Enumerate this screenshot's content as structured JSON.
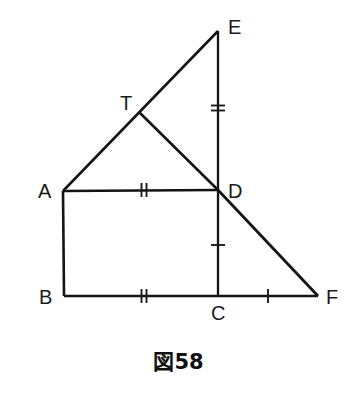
{
  "figure": {
    "caption": "図58",
    "background_color": "#ffffff",
    "line_color": "#141414",
    "label_color": "#1a1a1a",
    "vertices": [
      {
        "name": "A",
        "label": "A",
        "x": 63,
        "y": 191,
        "label_x": 38,
        "label_y": 198
      },
      {
        "name": "B",
        "label": "B",
        "x": 64,
        "y": 296,
        "label_x": 39,
        "label_y": 304
      },
      {
        "name": "C",
        "label": "C",
        "x": 218,
        "y": 296,
        "label_x": 211,
        "label_y": 320
      },
      {
        "name": "D",
        "label": "D",
        "x": 218,
        "y": 190,
        "label_x": 228,
        "label_y": 198
      },
      {
        "name": "E",
        "label": "E",
        "x": 218,
        "y": 31,
        "label_x": 228,
        "label_y": 34
      },
      {
        "name": "F",
        "label": "F",
        "x": 318,
        "y": 296,
        "label_x": 326,
        "label_y": 304
      },
      {
        "name": "T",
        "label": "T",
        "x": 140,
        "y": 113,
        "label_x": 120,
        "label_y": 110
      }
    ],
    "segments": [
      {
        "name": "segment-A-E",
        "from": "A",
        "to": "E",
        "x1": 63,
        "y1": 191,
        "x2": 218,
        "y2": 31,
        "width": 2.6
      },
      {
        "name": "segment-T-D",
        "from": "T",
        "to": "D",
        "x1": 140,
        "y1": 113,
        "x2": 218,
        "y2": 190,
        "width": 2.6
      },
      {
        "name": "segment-E-C",
        "from": "E",
        "to": "C",
        "x1": 218,
        "y1": 31,
        "x2": 218,
        "y2": 296,
        "width": 2.3
      },
      {
        "name": "segment-A-D",
        "from": "A",
        "to": "D",
        "x1": 63,
        "y1": 191,
        "x2": 218,
        "y2": 190,
        "width": 2.6
      },
      {
        "name": "segment-A-B",
        "from": "A",
        "to": "B",
        "x1": 63,
        "y1": 191,
        "x2": 64,
        "y2": 296,
        "width": 2.6
      },
      {
        "name": "segment-B-C",
        "from": "B",
        "to": "C",
        "x1": 64,
        "y1": 296,
        "x2": 218,
        "y2": 296,
        "width": 2.6
      },
      {
        "name": "segment-C-F",
        "from": "C",
        "to": "F",
        "x1": 218,
        "y1": 296,
        "x2": 318,
        "y2": 296,
        "width": 2.6
      },
      {
        "name": "segment-D-F",
        "from": "D",
        "to": "F",
        "x1": 218,
        "y1": 190,
        "x2": 318,
        "y2": 296,
        "width": 2.8
      }
    ],
    "tick_marks": [
      {
        "name": "tick-segment-E-D",
        "on": "ED",
        "count": 2,
        "orientation": "horizontal",
        "cx": 218,
        "cy": 108,
        "length": 14,
        "gap": 5
      },
      {
        "name": "tick-segment-A-D",
        "on": "AD",
        "count": 2,
        "orientation": "vertical",
        "cx": 144,
        "cy": 190,
        "length": 14,
        "gap": 5
      },
      {
        "name": "tick-segment-B-C",
        "on": "BC",
        "count": 2,
        "orientation": "vertical",
        "cx": 144,
        "cy": 296,
        "length": 14,
        "gap": 5
      },
      {
        "name": "tick-segment-D-C",
        "on": "DC",
        "count": 1,
        "orientation": "horizontal",
        "cx": 218,
        "cy": 245,
        "length": 14,
        "gap": 0
      },
      {
        "name": "tick-segment-C-F",
        "on": "CF",
        "count": 1,
        "orientation": "vertical",
        "cx": 268,
        "cy": 296,
        "length": 14,
        "gap": 0
      }
    ]
  },
  "geometry_data": {
    "type": "diagram",
    "title": "図58",
    "description": "Plane geometry figure: square ABCD with right triangles attached",
    "points": {
      "A": [
        63,
        191
      ],
      "B": [
        64,
        296
      ],
      "C": [
        218,
        296
      ],
      "D": [
        218,
        190
      ],
      "E": [
        218,
        31
      ],
      "F": [
        318,
        296
      ],
      "T": [
        140,
        113
      ]
    },
    "edges": [
      "A-E",
      "T-D",
      "E-C",
      "A-D",
      "A-B",
      "B-C",
      "C-F",
      "D-F"
    ],
    "congruence_groups": [
      {
        "marks": 2,
        "segments": [
          "E-D",
          "A-D",
          "B-C"
        ]
      },
      {
        "marks": 1,
        "segments": [
          "D-C",
          "C-F"
        ]
      }
    ]
  }
}
